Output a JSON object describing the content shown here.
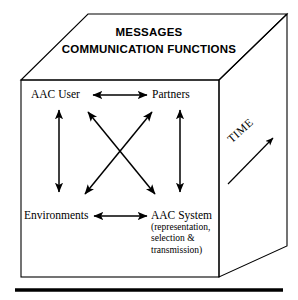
{
  "figure": {
    "ink_color": "#000000",
    "background": "#ffffff"
  },
  "top_face": {
    "line1": "MESSAGES",
    "line2": "COMMUNICATION FUNCTIONS"
  },
  "front_face": {
    "nodes": {
      "top_left": "AAC User",
      "top_right": "Partners",
      "bottom_left": "Environments",
      "bottom_right_title": "AAC System",
      "bottom_right_sub": "(representation, selection & transmission)",
      "bottom_right_sub_line1": "(representation,",
      "bottom_right_sub_line2": "selection &",
      "bottom_right_sub_line3": "transmission)"
    },
    "connections": [
      {
        "from": "AAC User",
        "to": "Partners",
        "style": "double-arrow-horizontal"
      },
      {
        "from": "Environments",
        "to": "AAC System",
        "style": "double-arrow-horizontal"
      },
      {
        "from": "AAC User",
        "to": "Environments",
        "style": "double-arrow-vertical"
      },
      {
        "from": "Partners",
        "to": "AAC System",
        "style": "double-arrow-vertical"
      },
      {
        "from": "AAC User",
        "to": "AAC System",
        "style": "double-arrow-diagonal"
      },
      {
        "from": "Partners",
        "to": "Environments",
        "style": "double-arrow-diagonal"
      }
    ]
  },
  "right_face": {
    "axis_label": "TIME",
    "axis_direction": "up-right"
  }
}
